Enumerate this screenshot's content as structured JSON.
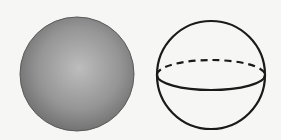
{
  "figure": {
    "left_sphere": {
      "type": "shaded-sphere",
      "fill_light": "#bdbdbd",
      "fill_dark": "#6a6a6a"
    },
    "right_sphere": {
      "type": "outline-sphere",
      "stroke": "#1a1a1a",
      "equator_front": "solid",
      "equator_back": "dashed"
    }
  }
}
